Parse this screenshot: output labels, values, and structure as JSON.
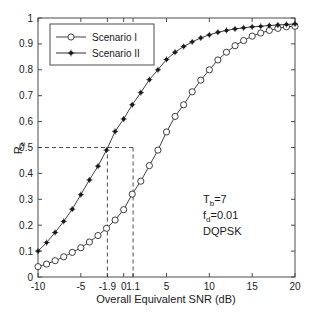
{
  "chart_data": {
    "type": "line",
    "title": "",
    "xlabel": "Overall Equivalent SNR (dB)",
    "ylabel": "R",
    "ylabel_sub": "e",
    "xlim": [
      -10,
      20
    ],
    "ylim": [
      0,
      1
    ],
    "xticks": [
      -10,
      -5,
      -1.9,
      0,
      1.1,
      5,
      10,
      15,
      20
    ],
    "xtick_labels": [
      "-10",
      "-5",
      "-1.9",
      "0",
      "1.1",
      "5",
      "10",
      "15",
      "20"
    ],
    "yticks": [
      0,
      0.1,
      0.2,
      0.3,
      0.4,
      0.5,
      0.6,
      0.7,
      0.8,
      0.9,
      1
    ],
    "ytick_labels": [
      "0",
      "0.1",
      "0.2",
      "0.3",
      "0.4",
      "0.5",
      "0.6",
      "0.7",
      "0.8",
      "0.9",
      "1"
    ],
    "grid": false,
    "legend_position": "top-left",
    "series": [
      {
        "name": "Scenario I",
        "marker": "open-circle",
        "color": "#2b2b2b",
        "x": [
          -10,
          -9,
          -8,
          -7,
          -6,
          -5,
          -4,
          -3,
          -2,
          -1,
          0,
          1,
          2,
          3,
          4,
          5,
          6,
          7,
          8,
          9,
          10,
          11,
          12,
          13,
          14,
          15,
          16,
          17,
          18,
          19,
          20
        ],
        "y": [
          0.04,
          0.05,
          0.063,
          0.078,
          0.095,
          0.113,
          0.135,
          0.16,
          0.188,
          0.22,
          0.26,
          0.32,
          0.37,
          0.43,
          0.49,
          0.56,
          0.62,
          0.665,
          0.715,
          0.76,
          0.8,
          0.838,
          0.868,
          0.893,
          0.913,
          0.93,
          0.942,
          0.952,
          0.96,
          0.966,
          0.968
        ]
      },
      {
        "name": "Scenario II",
        "marker": "filled-star",
        "color": "#1a1a1a",
        "x": [
          -10,
          -9,
          -8,
          -7,
          -6,
          -5,
          -4,
          -3,
          -2,
          -1,
          0,
          1,
          2,
          3,
          4,
          5,
          6,
          7,
          8,
          9,
          10,
          11,
          12,
          13,
          14,
          15,
          16,
          17,
          18,
          19,
          20
        ],
        "y": [
          0.1,
          0.133,
          0.172,
          0.215,
          0.262,
          0.318,
          0.375,
          0.428,
          0.49,
          0.562,
          0.61,
          0.665,
          0.712,
          0.762,
          0.8,
          0.84,
          0.868,
          0.89,
          0.908,
          0.923,
          0.935,
          0.945,
          0.952,
          0.958,
          0.962,
          0.966,
          0.968,
          0.971,
          0.973,
          0.975,
          0.977
        ]
      }
    ],
    "reference_lines": [
      {
        "orientation": "horizontal",
        "value": 0.5,
        "style": "dashed"
      },
      {
        "orientation": "vertical",
        "value": -1.9,
        "style": "dashed"
      },
      {
        "orientation": "vertical",
        "value": 1.1,
        "style": "dashed"
      }
    ],
    "annotations": [
      {
        "text": "T",
        "sub": "b",
        "rest": "=7"
      },
      {
        "text": "f",
        "sub": "d",
        "rest": "=0.01"
      },
      {
        "text": "DQPSK",
        "sub": "",
        "rest": ""
      }
    ]
  },
  "legend": {
    "items": [
      {
        "label": "Scenario I"
      },
      {
        "label": "Scenario II"
      }
    ]
  },
  "annotation_block": {
    "line1_base": "T",
    "line1_sub": "b",
    "line1_rest": "=7",
    "line2_base": "f",
    "line2_sub": "d",
    "line2_rest": "=0.01",
    "line3": "DQPSK"
  },
  "axes": {
    "x_title": "Overall Equivalent SNR (dB)",
    "y_title_base": "R",
    "y_title_sub": "e"
  }
}
